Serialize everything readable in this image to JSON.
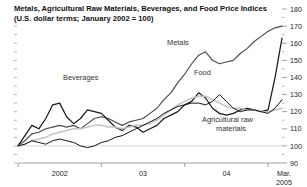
{
  "chart_data": {
    "type": "line",
    "title": "Metals, Agricultural Raw Materials, Beverages, and Food Price Indices",
    "subtitle": "(U.S. dollar terms; January 2002 = 100)",
    "xlabel": "",
    "ylabel": "",
    "ylim": [
      90,
      180
    ],
    "yticks": [
      90,
      100,
      110,
      120,
      130,
      140,
      150,
      160,
      170,
      180
    ],
    "ytick_labels": [
      "90",
      "100",
      "110",
      "120",
      "130",
      "140",
      "150",
      "160",
      "170",
      "180"
    ],
    "y_axis_position": "right",
    "grid": "horizontal-at-100-only",
    "legend": "inline-annotations",
    "x_range": [
      "2002-01",
      "2005-03"
    ],
    "xticks": [
      "2002-01",
      "2003-01",
      "2004-01",
      "2005-01"
    ],
    "xtick_labels": [
      "2002",
      "03",
      "04",
      "Mar.\n2005"
    ],
    "xtick_label_lines": [
      [
        "2002"
      ],
      [
        "03"
      ],
      [
        "04"
      ],
      [
        "Mar.",
        "2005"
      ]
    ],
    "x_months": [
      "2002-01",
      "2002-02",
      "2002-03",
      "2002-04",
      "2002-05",
      "2002-06",
      "2002-07",
      "2002-08",
      "2002-09",
      "2002-10",
      "2002-11",
      "2002-12",
      "2003-01",
      "2003-02",
      "2003-03",
      "2003-04",
      "2003-05",
      "2003-06",
      "2003-07",
      "2003-08",
      "2003-09",
      "2003-10",
      "2003-11",
      "2003-12",
      "2004-01",
      "2004-02",
      "2004-03",
      "2004-04",
      "2004-05",
      "2004-06",
      "2004-07",
      "2004-08",
      "2004-09",
      "2004-10",
      "2004-11",
      "2004-12",
      "2005-01",
      "2005-02",
      "2005-03"
    ],
    "series": [
      {
        "name": "Metals",
        "label": "Metals",
        "color": "#4a4a4a",
        "stroke_width": 1.15,
        "values": [
          100,
          103,
          107,
          108,
          110,
          111,
          112,
          111,
          112,
          110,
          113,
          116,
          117,
          116,
          114,
          112,
          114,
          115,
          116,
          119,
          122,
          127,
          131,
          137,
          142,
          148,
          153,
          155,
          150,
          148,
          149,
          150,
          154,
          157,
          161,
          164,
          167,
          169,
          170
        ]
      },
      {
        "name": "Beverages",
        "label": "Beverages",
        "color": "#1a1a1a",
        "stroke_width": 1.25,
        "values": [
          100,
          106,
          112,
          110,
          116,
          124,
          125,
          117,
          113,
          116,
          121,
          120,
          119,
          115,
          111,
          109,
          112,
          111,
          108,
          110,
          112,
          116,
          118,
          120,
          124,
          126,
          131,
          128,
          122,
          119,
          118,
          119,
          121,
          122,
          121,
          120,
          121,
          140,
          163
        ]
      },
      {
        "name": "Food",
        "label": "Food",
        "color": "#c2c2c2",
        "stroke_width": 1.5,
        "values": [
          100,
          101,
          103,
          104,
          105,
          107,
          108,
          109,
          110,
          110,
          111,
          112,
          112,
          111,
          111,
          110,
          111,
          112,
          112,
          113,
          115,
          118,
          121,
          124,
          126,
          128,
          129,
          129,
          127,
          125,
          123,
          122,
          122,
          121,
          121,
          120,
          120,
          121,
          122
        ]
      },
      {
        "name": "Agricultural raw materials",
        "label": "Agricultural raw\nmaterials",
        "label_lines": [
          "Agricultural raw",
          "materials"
        ],
        "color": "#151515",
        "stroke_width": 1.0,
        "values": [
          100,
          101,
          103,
          102,
          101,
          103,
          104,
          103,
          102,
          100,
          99,
          100,
          102,
          103,
          105,
          106,
          108,
          110,
          112,
          114,
          116,
          119,
          121,
          123,
          124,
          125,
          125,
          124,
          126,
          130,
          126,
          122,
          120,
          121,
          121,
          120,
          119,
          122,
          127
        ]
      }
    ],
    "annotations": [
      {
        "name": "metals-label",
        "text": "Metals",
        "x": 167,
        "y": 45
      },
      {
        "name": "beverages-label",
        "text": "Beverages",
        "x": 63,
        "y": 80
      },
      {
        "name": "food-label",
        "text": "Food",
        "x": 194,
        "y": 75
      },
      {
        "name": "agricultural-raw-materials-label-line1",
        "text": "Agricultural raw",
        "x": 202,
        "y": 122
      },
      {
        "name": "agricultural-raw-materials-label-line2",
        "text": "materials",
        "x": 216,
        "y": 131
      }
    ]
  }
}
